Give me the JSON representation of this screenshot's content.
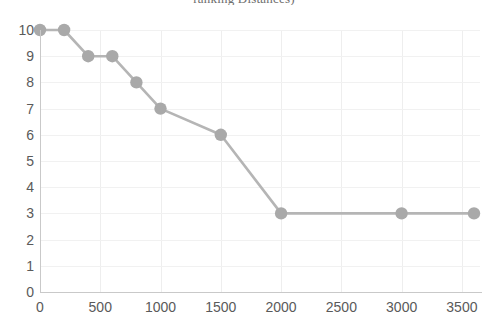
{
  "chart_data": {
    "type": "line",
    "title": "ranking Distances)",
    "xlabel": "",
    "ylabel": "",
    "xlim": [
      0,
      3650
    ],
    "ylim": [
      0,
      10
    ],
    "xticks": [
      0,
      500,
      1000,
      1500,
      2000,
      2500,
      3000,
      3500
    ],
    "yticks": [
      0,
      1,
      2,
      3,
      4,
      5,
      6,
      7,
      8,
      9,
      10
    ],
    "grid": true,
    "legend": "none",
    "marker": "circle",
    "line_color": "#b5b5b5",
    "marker_color": "#a9a9a9",
    "x": [
      0,
      200,
      400,
      600,
      800,
      1000,
      1500,
      2000,
      3000,
      3600
    ],
    "values": [
      10,
      10,
      9,
      9,
      8,
      7,
      6,
      3,
      3,
      3
    ],
    "points": [
      {
        "x": 0,
        "y": 10
      },
      {
        "x": 200,
        "y": 10
      },
      {
        "x": 400,
        "y": 9
      },
      {
        "x": 600,
        "y": 9
      },
      {
        "x": 800,
        "y": 8
      },
      {
        "x": 1000,
        "y": 7
      },
      {
        "x": 1500,
        "y": 6
      },
      {
        "x": 2000,
        "y": 3
      },
      {
        "x": 3000,
        "y": 3
      },
      {
        "x": 3600,
        "y": 3
      }
    ]
  }
}
